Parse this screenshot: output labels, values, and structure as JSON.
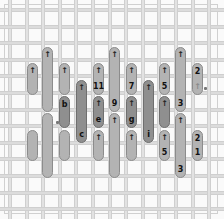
{
  "board": {
    "type": "vertical-peg-puzzle",
    "colors": {
      "light_piece": "#b3b3b3",
      "dark_piece": "#8f8f8f",
      "grid": "#dcdcdc",
      "background": "#fafafa"
    },
    "pieces": [
      {
        "id": "p1",
        "shade": "light",
        "arrow": "up",
        "label": ""
      },
      {
        "id": "p2",
        "shade": "light",
        "arrow": "",
        "label": ""
      },
      {
        "id": "p3",
        "shade": "light",
        "arrow": "up",
        "label": ""
      },
      {
        "id": "p4",
        "shade": "light",
        "arrow": "",
        "label": ""
      },
      {
        "id": "p5",
        "shade": "light",
        "arrow": "up",
        "label": ""
      },
      {
        "id": "p6",
        "shade": "dark",
        "arrow": "",
        "label": "b"
      },
      {
        "id": "p7",
        "shade": "light",
        "arrow": "",
        "label": ""
      },
      {
        "id": "p8",
        "shade": "dark",
        "arrow": "up",
        "label": "c"
      },
      {
        "id": "p9",
        "shade": "light",
        "arrow": "up",
        "label": "11"
      },
      {
        "id": "p10",
        "shade": "dark",
        "arrow": "up",
        "label": "e"
      },
      {
        "id": "p11",
        "shade": "light",
        "arrow": "up",
        "label": ""
      },
      {
        "id": "p12",
        "shade": "light",
        "arrow": "up",
        "label": "9"
      },
      {
        "id": "p13",
        "shade": "light",
        "arrow": "up",
        "label": ""
      },
      {
        "id": "p14",
        "shade": "light",
        "arrow": "up",
        "label": "7"
      },
      {
        "id": "p15",
        "shade": "dark",
        "arrow": "up",
        "label": "g"
      },
      {
        "id": "p16",
        "shade": "light",
        "arrow": "up",
        "label": ""
      },
      {
        "id": "p17",
        "shade": "dark",
        "arrow": "up",
        "label": "i"
      },
      {
        "id": "p18",
        "shade": "light",
        "arrow": "up",
        "label": "5"
      },
      {
        "id": "p19",
        "shade": "dark",
        "arrow": "up",
        "label": ""
      },
      {
        "id": "p20",
        "shade": "light",
        "arrow": "up",
        "label": "5"
      },
      {
        "id": "p21",
        "shade": "light",
        "arrow": "up",
        "label": "3"
      },
      {
        "id": "p22",
        "shade": "light",
        "arrow": "up",
        "label": "3"
      },
      {
        "id": "p23",
        "shade": "light",
        "arrow": "faint-up",
        "label": "2"
      },
      {
        "id": "p24",
        "shade": "light",
        "arrow": "",
        "label": "2"
      }
    ],
    "extra_labels": {
      "p24_bottom": "1"
    },
    "glyphs": {
      "arrow": "↑"
    }
  }
}
